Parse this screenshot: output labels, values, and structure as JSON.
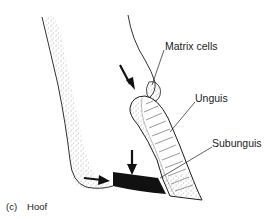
{
  "figure": {
    "panel_letter": "(c)",
    "caption": "Hoof"
  },
  "labels": [
    {
      "id": "matrix-cells",
      "text": "Matrix cells"
    },
    {
      "id": "unguis",
      "text": "Unguis"
    },
    {
      "id": "subunguis",
      "text": "Subunguis"
    }
  ],
  "arrows": [
    {
      "id": "arrow-upper",
      "direction": "down-right"
    },
    {
      "id": "arrow-lower-vertical",
      "direction": "down"
    },
    {
      "id": "arrow-lower-horizontal",
      "direction": "right"
    }
  ],
  "colors": {
    "stroke": "#1a1a1a",
    "stipple": "#555555",
    "fill_black": "#111111",
    "background": "#ffffff"
  }
}
